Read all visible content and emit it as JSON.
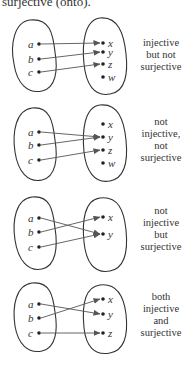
{
  "caption": "surjective (onto).",
  "colors": {
    "ink": "#222222",
    "arrow": "#555555",
    "background": "#ffffff"
  },
  "diagrams": [
    {
      "name": "injective-not-surjective",
      "description_lines": [
        "injective",
        "but not",
        "surjective"
      ],
      "desc_y": 46,
      "left_blob": "M30,20 C14,22 10,45 14,64 C17,84 28,94 42,91 C56,88 58,70 55,52 C53,34 50,18 30,20 Z",
      "right_blob": "M100,18 C84,20 82,45 84,64 C86,84 94,97 110,94 C126,92 128,72 126,54 C124,34 118,16 100,18 Z",
      "domain": [
        {
          "label": "a",
          "x": 39,
          "y": 44
        },
        {
          "label": "b",
          "x": 39,
          "y": 59
        },
        {
          "label": "c",
          "x": 39,
          "y": 72
        }
      ],
      "codomain": [
        {
          "label": "x",
          "x": 103,
          "y": 43
        },
        {
          "label": "y",
          "x": 103,
          "y": 52
        },
        {
          "label": "z",
          "x": 103,
          "y": 64
        },
        {
          "label": "w",
          "x": 103,
          "y": 77
        }
      ],
      "mapping": [
        [
          "a",
          "x"
        ],
        [
          "b",
          "y"
        ],
        [
          "c",
          "z"
        ]
      ]
    },
    {
      "name": "not-injective-not-surjective",
      "description_lines": [
        "not",
        "injective,",
        "not",
        "surjective"
      ],
      "desc_y": 125,
      "left_blob": "M32,108 C16,110 12,132 15,152 C18,172 28,183 42,180 C56,177 58,158 55,140 C53,122 50,106 32,108 Z",
      "right_blob": "M100,105 C84,107 82,132 84,152 C86,170 94,184 110,181 C126,178 128,160 126,140 C124,120 118,103 100,105 Z",
      "domain": [
        {
          "label": "a",
          "x": 39,
          "y": 132
        },
        {
          "label": "b",
          "x": 39,
          "y": 145
        },
        {
          "label": "c",
          "x": 39,
          "y": 160
        }
      ],
      "codomain": [
        {
          "label": "x",
          "x": 103,
          "y": 124
        },
        {
          "label": "y",
          "x": 103,
          "y": 137
        },
        {
          "label": "z",
          "x": 103,
          "y": 150
        },
        {
          "label": "w",
          "x": 103,
          "y": 163
        }
      ],
      "mapping": [
        [
          "a",
          "y"
        ],
        [
          "b",
          "y"
        ],
        [
          "c",
          "z"
        ]
      ]
    },
    {
      "name": "not-injective-surjective",
      "description_lines": [
        "not",
        "injective",
        "but",
        "surjective"
      ],
      "desc_y": 214,
      "left_blob": "M32,197 C16,199 12,220 15,240 C18,260 28,272 42,269 C56,266 58,247 55,228 C53,210 50,195 32,197 Z",
      "right_blob": "M100,198 C84,200 82,222 84,242 C86,262 94,274 110,271 C126,268 128,250 126,230 C124,210 118,196 100,198 Z",
      "domain": [
        {
          "label": "a",
          "x": 39,
          "y": 218
        },
        {
          "label": "b",
          "x": 39,
          "y": 232
        },
        {
          "label": "c",
          "x": 39,
          "y": 247
        }
      ],
      "codomain": [
        {
          "label": "x",
          "x": 103,
          "y": 217
        },
        {
          "label": "y",
          "x": 103,
          "y": 234
        }
      ],
      "mapping": [
        [
          "a",
          "y"
        ],
        [
          "b",
          "x"
        ],
        [
          "c",
          "y"
        ]
      ]
    },
    {
      "name": "injective-and-surjective",
      "description_lines": [
        "both",
        "injective",
        "and",
        "surjective"
      ],
      "desc_y": 300,
      "left_blob": "M32,283 C16,285 12,306 15,326 C18,344 28,354 42,351 C56,348 58,330 55,312 C53,296 50,281 32,283 Z",
      "right_blob": "M100,285 C84,287 82,308 84,328 C86,346 94,356 110,353 C126,350 128,332 126,314 C124,298 118,283 100,285 Z",
      "domain": [
        {
          "label": "a",
          "x": 39,
          "y": 304
        },
        {
          "label": "b",
          "x": 39,
          "y": 318
        },
        {
          "label": "c",
          "x": 39,
          "y": 333
        }
      ],
      "codomain": [
        {
          "label": "x",
          "x": 103,
          "y": 299
        },
        {
          "label": "y",
          "x": 103,
          "y": 314
        },
        {
          "label": "z",
          "x": 103,
          "y": 333
        }
      ],
      "mapping": [
        [
          "a",
          "y"
        ],
        [
          "b",
          "x"
        ],
        [
          "c",
          "z"
        ]
      ]
    }
  ]
}
